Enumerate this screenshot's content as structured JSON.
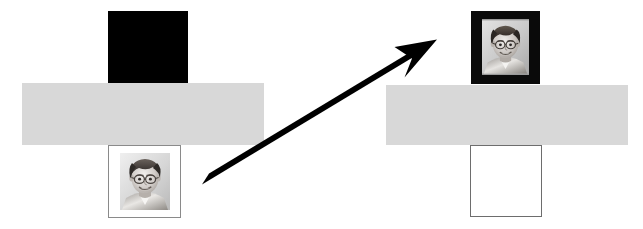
{
  "figure": {
    "background_color": "#ffffff",
    "width": 643,
    "height": 229
  },
  "palette": {
    "black": "#000000",
    "gray_bar": "#d8d8d8",
    "white": "#ffffff",
    "thin_outline": "#6d6d6d",
    "photo_outline": "#8a8a8a",
    "arrow": "#000000"
  },
  "panels": [
    {
      "id": "left-panel",
      "name": "before-state",
      "label": "",
      "bar": {
        "x": 22,
        "y": 83,
        "width": 242,
        "height": 62,
        "color": "#d8d8d8"
      },
      "top_slot": {
        "kind": "black-square",
        "name": "top-slot-blanked",
        "x": 108,
        "y": 11,
        "width": 80,
        "height": 72,
        "fill": "#000000",
        "contents": ""
      },
      "bottom_slot": {
        "kind": "photo-card",
        "name": "bottom-slot-portrait",
        "x": 108,
        "y": 145,
        "width": 73,
        "height": 73,
        "mat": "#ffffff",
        "outline": "#8a8a8a",
        "photo": {
          "name": "child-portrait-photo",
          "alt": "Black and white portrait of a young child with short dark hair and glasses",
          "x": 8,
          "y": 7,
          "width": 50,
          "height": 57
        }
      }
    },
    {
      "id": "right-panel",
      "name": "after-state",
      "label": "",
      "bar": {
        "x": 386,
        "y": 85,
        "width": 242,
        "height": 60,
        "color": "#d8d8d8"
      },
      "top_slot": {
        "kind": "photo-card-dark",
        "name": "top-slot-portrait",
        "x": 471,
        "y": 11,
        "width": 69,
        "height": 73,
        "mat": "#0a0a0a",
        "outline": "#0a0a0a",
        "photo": {
          "name": "child-portrait-photo",
          "alt": "Black and white portrait of a young child with short dark hair and glasses",
          "x": 10,
          "y": 7,
          "width": 47,
          "height": 56
        }
      },
      "bottom_slot": {
        "kind": "empty-square",
        "name": "bottom-slot-empty",
        "x": 470,
        "y": 145,
        "width": 72,
        "height": 72,
        "fill": "#ffffff",
        "outline": "#6d6d6d",
        "contents": ""
      }
    }
  ],
  "arrow": {
    "name": "transition-arrow",
    "label": "",
    "from": {
      "x": 205,
      "y": 180
    },
    "to": {
      "x": 437,
      "y": 40
    },
    "thickness": 13,
    "head_length": 34,
    "head_width": 34,
    "color": "#000000",
    "direction": "up-right"
  }
}
